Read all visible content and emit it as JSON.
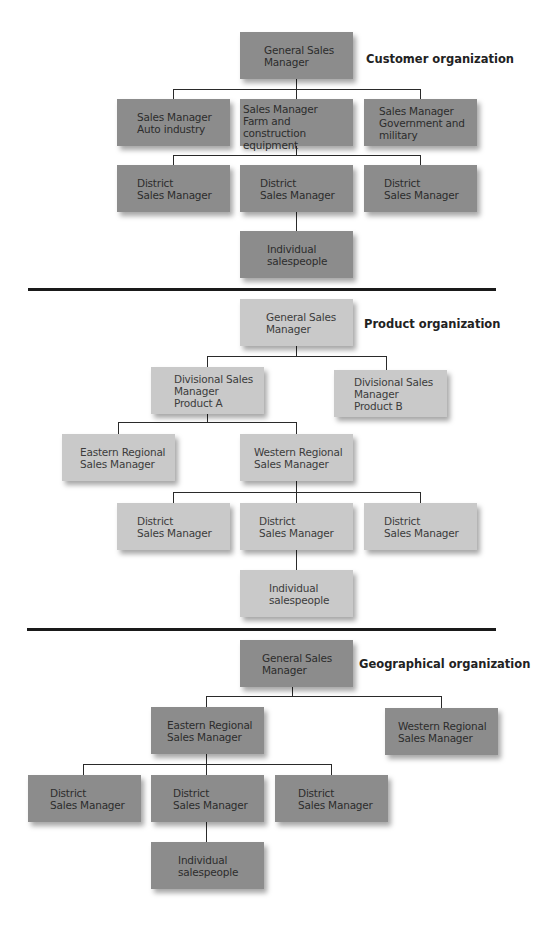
{
  "customer_org": {
    "title": "Customer organization",
    "general_manager": "General Sales\nManager",
    "sales_managers": [
      "Sales Manager\nAuto industry",
      "Sales Manager\nFarm and construction\nequipment",
      "Sales Manager\nGovernment and\nmilitary"
    ],
    "district_managers": [
      "District\nSales Manager",
      "District\nSales Manager",
      "District\nSales Manager"
    ],
    "individual": "Individual\nsalespeople"
  },
  "product_org": {
    "title": "Product organization",
    "general_manager": "General Sales\nManager",
    "divisional_managers": [
      "Divisional Sales\nManager\nProduct A",
      "Divisional Sales\nManager\nProduct B"
    ],
    "regional_managers": [
      "Eastern Regional\nSales Manager",
      "Western Regional\nSales Manager"
    ],
    "district_managers": [
      "District\nSales Manager",
      "District\nSales Manager",
      "District\nSales Manager"
    ],
    "individual": "Individual\nsalespeople"
  },
  "geographical_org": {
    "title": "Geographical organization",
    "general_manager": "General Sales\nManager",
    "regional_managers": [
      "Eastern Regional\nSales Manager",
      "Western Regional\nSales Manager"
    ],
    "district_managers": [
      "District\nSales Manager",
      "District\nSales Manager",
      "District\nSales Manager"
    ],
    "individual": "Individual\nsalespeople"
  },
  "colors": {
    "dark_box": "#8c8c8c",
    "light_box": "#c9c9c9",
    "line": "#2a2a2a"
  }
}
